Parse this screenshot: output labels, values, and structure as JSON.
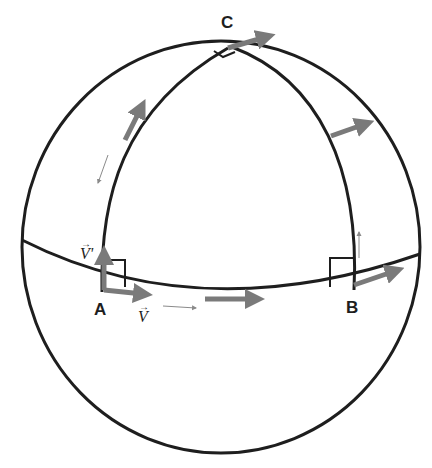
{
  "figure": {
    "colors": {
      "line": "#1e1e1e",
      "vector": "#7a7a7a",
      "small_arrow": "#8a8a8a",
      "background": "#ffffff"
    },
    "points": [
      {
        "id": "A",
        "label": "A"
      },
      {
        "id": "B",
        "label": "B"
      },
      {
        "id": "C",
        "label": "C"
      }
    ],
    "vectors": [
      {
        "id": "v",
        "label": "V",
        "decoration": "→"
      },
      {
        "id": "v_prime",
        "label": "V'",
        "decoration": "→"
      }
    ],
    "right_angles": [
      "A",
      "B",
      "C"
    ]
  }
}
